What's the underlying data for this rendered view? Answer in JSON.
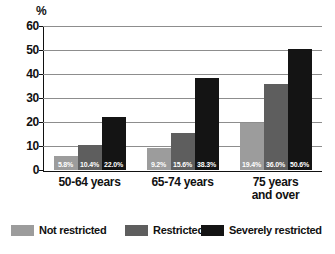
{
  "chart_data": {
    "type": "bar",
    "title": "",
    "subtitle": "",
    "xlabel": "",
    "ylabel": "%",
    "unit_label": "%",
    "ylim": [
      0,
      60
    ],
    "ytick_step": 10,
    "yticks": [
      "60",
      "50",
      "40",
      "30",
      "20",
      "10",
      "0"
    ],
    "grid": true,
    "legend_position": "bottom",
    "categories": [
      "50-64 years",
      "65-74 years",
      "75 years and over"
    ],
    "category_lines": [
      [
        "50-64 years"
      ],
      [
        "65-74 years"
      ],
      [
        "75 years",
        "and over"
      ]
    ],
    "series": [
      {
        "name": "Not restricted",
        "color": "#9c9c9c",
        "values": [
          5.8,
          10.4,
          19.4
        ],
        "labels": [
          "5.8%",
          "9.2%",
          "19.4%"
        ]
      },
      {
        "name": "Restricted",
        "color": "#5e5e5e",
        "values": [
          10.4,
          15.6,
          36.0
        ],
        "labels": [
          "10.4%",
          "15.6%",
          "36.0%"
        ]
      },
      {
        "name": "Severely restricted",
        "color": "#141414",
        "values": [
          22.0,
          38.3,
          50.6
        ],
        "labels": [
          "22.0%",
          "38.3%",
          "50.6%"
        ]
      }
    ],
    "data_points": [
      {
        "category": "50-64 years",
        "series": "Not restricted",
        "value": 5.8,
        "label": "5.8%"
      },
      {
        "category": "50-64 years",
        "series": "Restricted",
        "value": 10.4,
        "label": "10.4%"
      },
      {
        "category": "50-64 years",
        "series": "Severely restricted",
        "value": 22.0,
        "label": "22.0%"
      },
      {
        "category": "65-74 years",
        "series": "Not restricted",
        "value": 9.2,
        "label": "9.2%"
      },
      {
        "category": "65-74 years",
        "series": "Restricted",
        "value": 15.6,
        "label": "15.6%"
      },
      {
        "category": "65-74 years",
        "series": "Severely restricted",
        "value": 38.3,
        "label": "38.3%"
      },
      {
        "category": "75 years and over",
        "series": "Not restricted",
        "value": 19.4,
        "label": "19.4%"
      },
      {
        "category": "75 years and over",
        "series": "Restricted",
        "value": 36.0,
        "label": "36.0%"
      },
      {
        "category": "75 years and over",
        "series": "Severely restricted",
        "value": 50.6,
        "label": "50.6%"
      }
    ]
  },
  "legend": {
    "items": [
      {
        "label": "Not restricted",
        "color": "#9c9c9c"
      },
      {
        "label": "Restricted",
        "color": "#5e5e5e"
      },
      {
        "label": "Severely restricted",
        "color": "#141414"
      }
    ]
  },
  "colors": {
    "not_restricted": "#9c9c9c",
    "restricted": "#5e5e5e",
    "severely_restricted": "#141414",
    "axis": "#111111",
    "gridline": "#8d8d8d",
    "background": "#ffffff",
    "value_label_text": "#ffffff"
  }
}
